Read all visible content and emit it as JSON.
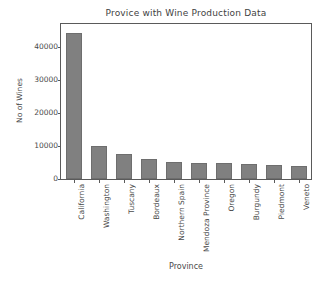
{
  "chart_data": {
    "type": "bar",
    "title": "Provice with Wine Production Data",
    "xlabel": "Province",
    "ylabel": "No of Wines",
    "categories": [
      "California",
      "Washington",
      "Tuscany",
      "Bordeaux",
      "Northern Spain",
      "Mendoza Province",
      "Oregon",
      "Burgundy",
      "Piedmont",
      "Veneto"
    ],
    "values": [
      44200,
      9900,
      7500,
      6200,
      5200,
      5000,
      4800,
      4500,
      4300,
      4000
    ],
    "ylim": [
      0,
      47000
    ],
    "yticks": [
      0,
      10000,
      20000,
      30000,
      40000
    ],
    "ytick_labels": [
      "0",
      "10000",
      "20000",
      "30000",
      "40000"
    ],
    "grid": false,
    "legend": null,
    "bar_color": "#808080",
    "bar_edge_color": "#6e6e6e",
    "axis_color": "#5a5a5a",
    "background": "#ffffff"
  }
}
